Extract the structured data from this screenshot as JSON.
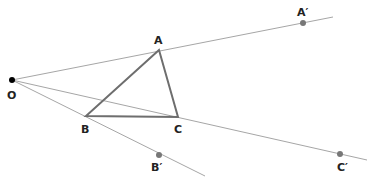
{
  "diagram": {
    "center": {
      "label": "O",
      "x": 12,
      "y": 80,
      "label_x": 7,
      "label_y": 99
    },
    "original": [
      {
        "label": "A",
        "x": 159,
        "y": 50,
        "label_x": 154,
        "label_y": 44
      },
      {
        "label": "B",
        "x": 86,
        "y": 116,
        "label_x": 81,
        "label_y": 133
      },
      {
        "label": "C",
        "x": 178,
        "y": 117,
        "label_x": 174,
        "label_y": 133
      }
    ],
    "image": [
      {
        "label": "A′",
        "x": 303,
        "y": 23,
        "label_x": 297,
        "label_y": 16
      },
      {
        "label": "B′",
        "x": 159,
        "y": 155,
        "label_x": 151,
        "label_y": 171
      },
      {
        "label": "C′",
        "x": 340,
        "y": 154,
        "label_x": 337,
        "label_y": 171
      }
    ],
    "rays": [
      {
        "from": "O",
        "through": "A",
        "end_x": 333,
        "end_y": 17
      },
      {
        "from": "O",
        "through": "B",
        "end_x": 205,
        "end_y": 176
      },
      {
        "from": "O",
        "through": "C",
        "end_x": 367,
        "end_y": 160
      }
    ],
    "colors": {
      "ray": "#a6a6a6",
      "triangle": "#6e6e6e",
      "image_point": "#777777",
      "center_point": "#000000"
    }
  }
}
